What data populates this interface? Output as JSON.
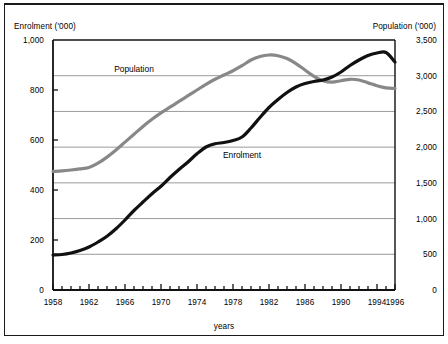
{
  "figure": {
    "left_axis_caption": "Enrolment ('000)",
    "right_axis_caption": "Population ('000)",
    "x_axis_caption": "years"
  },
  "labels": {
    "population_series": "Population",
    "enrolment_series": "Enrolment"
  },
  "colors": {
    "enrolment_line": "#111111",
    "population_line": "#888888",
    "gridline": "#9a9a9a",
    "axis": "#111111",
    "background": "#ffffff",
    "text": "#000000"
  },
  "chart_data": {
    "type": "line",
    "title": "",
    "subtitle": "",
    "xlabel": "years",
    "ylabel": "Enrolment ('000)",
    "y2label": "Population ('000)",
    "xlim": [
      1958,
      1996
    ],
    "ylim": [
      0,
      1000
    ],
    "y2lim": [
      0,
      3500
    ],
    "grid": true,
    "grid_axis": "y",
    "legend_position": "inline-annotation",
    "x_tick_labels": [
      "1958",
      "1962",
      "1966",
      "1970",
      "1974",
      "1978",
      "1982",
      "1986",
      "1990",
      "1994",
      "1996"
    ],
    "x_tick_values": [
      1958,
      1962,
      1966,
      1970,
      1974,
      1978,
      1982,
      1986,
      1990,
      1994,
      1996
    ],
    "x_minor_ticks_every": 1,
    "y_tick_labels": [
      "0",
      "200",
      "400",
      "600",
      "800",
      "1,000"
    ],
    "y_tick_values": [
      0,
      200,
      400,
      600,
      800,
      1000
    ],
    "y2_tick_labels": [
      "0",
      "500",
      "1,000",
      "1,500",
      "2,000",
      "2,500",
      "3,000",
      "3,500"
    ],
    "y2_tick_values": [
      0,
      500,
      1000,
      1500,
      2000,
      2500,
      3000,
      3500
    ],
    "x": [
      1958,
      1959,
      1960,
      1961,
      1962,
      1963,
      1964,
      1965,
      1966,
      1967,
      1968,
      1969,
      1970,
      1971,
      1972,
      1973,
      1974,
      1975,
      1976,
      1977,
      1978,
      1979,
      1980,
      1981,
      1982,
      1983,
      1984,
      1985,
      1986,
      1987,
      1988,
      1989,
      1990,
      1991,
      1992,
      1993,
      1994,
      1995,
      1996
    ],
    "series": [
      {
        "name": "Enrolment",
        "axis": "left",
        "units": "'000",
        "color": "#111111",
        "values": [
          140,
          142,
          148,
          158,
          172,
          192,
          215,
          245,
          280,
          318,
          352,
          385,
          415,
          450,
          482,
          512,
          545,
          572,
          585,
          590,
          598,
          612,
          648,
          690,
          730,
          762,
          790,
          812,
          826,
          834,
          840,
          852,
          872,
          898,
          920,
          938,
          948,
          950,
          912
        ]
      },
      {
        "name": "Population",
        "axis": "right",
        "units": "'000",
        "color": "#888888",
        "values": [
          1660,
          1668,
          1680,
          1695,
          1715,
          1775,
          1860,
          1960,
          2070,
          2180,
          2290,
          2390,
          2480,
          2560,
          2640,
          2720,
          2800,
          2880,
          2950,
          3010,
          3070,
          3140,
          3220,
          3270,
          3290,
          3280,
          3240,
          3170,
          3080,
          2990,
          2930,
          2910,
          2930,
          2950,
          2940,
          2900,
          2860,
          2830,
          2820
        ]
      }
    ],
    "annotations": [
      {
        "text": "Population",
        "x": 1967,
        "y_axis": "right",
        "y": 3050
      },
      {
        "text": "Enrolment",
        "x": 1979,
        "y_axis": "left",
        "y": 530
      }
    ]
  }
}
